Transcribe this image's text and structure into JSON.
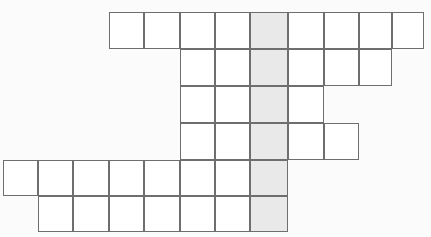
{
  "puzzle": {
    "title": "Crossword Grid",
    "type": "crossword-grid",
    "cell_size": 35.5,
    "origin_x": 4,
    "origin_y": 13,
    "rows": 6,
    "columns": 12,
    "colors": {
      "background": "#fbfbfb",
      "cell_fill": "#ffffff",
      "highlight_fill": "#e9e9e9",
      "border": "#6e6e6e"
    },
    "highlight_column_index": 7,
    "row_layout": [
      {
        "row": 1,
        "start_col": 3,
        "end_col": 11,
        "count": 9
      },
      {
        "row": 2,
        "start_col": 5,
        "end_col": 10,
        "count": 6
      },
      {
        "row": 3,
        "start_col": 5,
        "end_col": 8,
        "count": 4
      },
      {
        "row": 4,
        "start_col": 5,
        "end_col": 9,
        "count": 5
      },
      {
        "row": 5,
        "start_col": 0,
        "end_col": 7,
        "count": 8
      },
      {
        "row": 6,
        "start_col": 1,
        "end_col": 7,
        "count": 7
      }
    ],
    "column_edges": [
      4,
      39,
      74,
      110,
      145,
      181,
      216,
      251,
      289,
      325,
      360,
      393,
      425
    ],
    "row_edges": [
      13,
      50,
      87,
      124,
      161,
      197,
      233
    ],
    "cells": [
      {
        "row": 1,
        "col": 3,
        "letter": "",
        "shaded": false
      },
      {
        "row": 1,
        "col": 4,
        "letter": "",
        "shaded": false
      },
      {
        "row": 1,
        "col": 5,
        "letter": "",
        "shaded": false
      },
      {
        "row": 1,
        "col": 6,
        "letter": "",
        "shaded": false
      },
      {
        "row": 1,
        "col": 7,
        "letter": "",
        "shaded": true
      },
      {
        "row": 1,
        "col": 8,
        "letter": "",
        "shaded": false
      },
      {
        "row": 1,
        "col": 9,
        "letter": "",
        "shaded": false
      },
      {
        "row": 1,
        "col": 10,
        "letter": "",
        "shaded": false
      },
      {
        "row": 1,
        "col": 11,
        "letter": "",
        "shaded": false
      },
      {
        "row": 2,
        "col": 5,
        "letter": "",
        "shaded": false
      },
      {
        "row": 2,
        "col": 6,
        "letter": "",
        "shaded": false
      },
      {
        "row": 2,
        "col": 7,
        "letter": "",
        "shaded": true
      },
      {
        "row": 2,
        "col": 8,
        "letter": "",
        "shaded": false
      },
      {
        "row": 2,
        "col": 9,
        "letter": "",
        "shaded": false
      },
      {
        "row": 2,
        "col": 10,
        "letter": "",
        "shaded": false
      },
      {
        "row": 3,
        "col": 5,
        "letter": "",
        "shaded": false
      },
      {
        "row": 3,
        "col": 6,
        "letter": "",
        "shaded": false
      },
      {
        "row": 3,
        "col": 7,
        "letter": "",
        "shaded": true
      },
      {
        "row": 3,
        "col": 8,
        "letter": "",
        "shaded": false
      },
      {
        "row": 4,
        "col": 5,
        "letter": "",
        "shaded": false
      },
      {
        "row": 4,
        "col": 6,
        "letter": "",
        "shaded": false
      },
      {
        "row": 4,
        "col": 7,
        "letter": "",
        "shaded": true
      },
      {
        "row": 4,
        "col": 8,
        "letter": "",
        "shaded": false
      },
      {
        "row": 4,
        "col": 9,
        "letter": "",
        "shaded": false
      },
      {
        "row": 5,
        "col": 0,
        "letter": "",
        "shaded": false
      },
      {
        "row": 5,
        "col": 1,
        "letter": "",
        "shaded": false
      },
      {
        "row": 5,
        "col": 2,
        "letter": "",
        "shaded": false
      },
      {
        "row": 5,
        "col": 3,
        "letter": "",
        "shaded": false
      },
      {
        "row": 5,
        "col": 4,
        "letter": "",
        "shaded": false
      },
      {
        "row": 5,
        "col": 5,
        "letter": "",
        "shaded": false
      },
      {
        "row": 5,
        "col": 6,
        "letter": "",
        "shaded": false
      },
      {
        "row": 5,
        "col": 7,
        "letter": "",
        "shaded": true
      },
      {
        "row": 6,
        "col": 1,
        "letter": "",
        "shaded": false
      },
      {
        "row": 6,
        "col": 2,
        "letter": "",
        "shaded": false
      },
      {
        "row": 6,
        "col": 3,
        "letter": "",
        "shaded": false
      },
      {
        "row": 6,
        "col": 4,
        "letter": "",
        "shaded": false
      },
      {
        "row": 6,
        "col": 5,
        "letter": "",
        "shaded": false
      },
      {
        "row": 6,
        "col": 6,
        "letter": "",
        "shaded": false
      },
      {
        "row": 6,
        "col": 7,
        "letter": "",
        "shaded": true
      }
    ]
  }
}
